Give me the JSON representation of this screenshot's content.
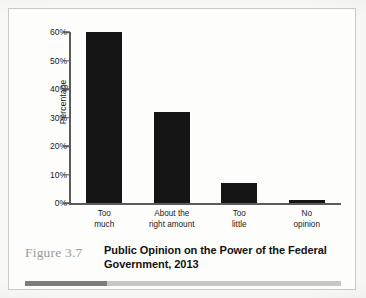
{
  "figure": {
    "number_label": "Figure 3.7",
    "title_line_1": "Public Opinion on the Power of the",
    "title_line_2": "Federal Government, 2013",
    "rule_dark_color": "#7d7d7d",
    "rule_light_color": "#c6c6c6",
    "rule_dark_fraction": 26
  },
  "chart_data": {
    "type": "bar",
    "title": "Public Opinion on the Power of the Federal Government, 2013",
    "categories": [
      "Too much",
      "About the right amount",
      "Too little",
      "No opinion"
    ],
    "category_lines": [
      [
        "Too",
        "much"
      ],
      [
        "About the",
        "right amount"
      ],
      [
        "Too",
        "little"
      ],
      [
        "No",
        "opinion"
      ]
    ],
    "values": [
      60,
      32,
      7,
      1
    ],
    "xlabel": "",
    "ylabel": "Percentage",
    "ylim": [
      0,
      60
    ],
    "ytick_values": [
      0,
      10,
      20,
      30,
      40,
      50,
      60
    ],
    "ytick_labels": [
      "0%",
      "10%",
      "20%",
      "30%",
      "40%",
      "50%",
      "60%"
    ],
    "grid": false,
    "legend": false,
    "bar_color": "#151515",
    "axis_color": "#5b5b5b"
  }
}
